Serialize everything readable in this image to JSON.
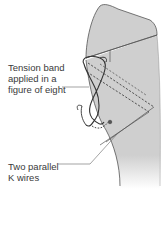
{
  "diagram": {
    "labels": {
      "tension_band": {
        "lines": [
          "Tension band",
          "applied in a",
          "figure of eight"
        ]
      },
      "k_wires": {
        "lines": [
          "Two parallel",
          "K wires"
        ]
      }
    },
    "colors": {
      "bone_fill": "#cfcfcf",
      "bone_outline": "#555555",
      "wire": "#3a3a3a",
      "leader_line": "#666666",
      "text": "#3a3a3a",
      "background": "#ffffff"
    }
  }
}
